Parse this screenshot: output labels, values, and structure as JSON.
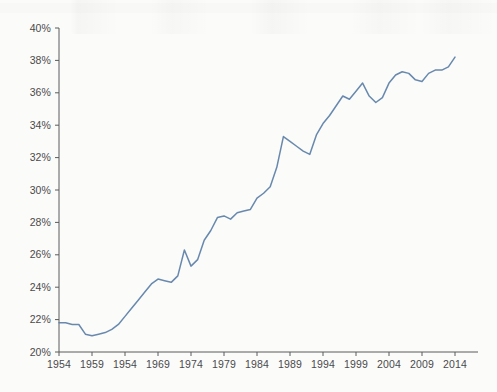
{
  "chart_data": {
    "type": "line",
    "title": "",
    "subtitle": "",
    "xlabel": "",
    "ylabel": "",
    "grid": false,
    "legend": null,
    "legend_position": "none",
    "line_color": "#5b7fa6",
    "axis_color": "#5a5a5a",
    "background_color": "#fbfbfa",
    "xlim": [
      1954,
      2015
    ],
    "ylim": [
      20,
      40
    ],
    "y_tick_labels": [
      "20%",
      "22%",
      "24%",
      "26%",
      "28%",
      "30%",
      "32%",
      "34%",
      "36%",
      "38%",
      "40%"
    ],
    "y_tick_values": [
      20,
      22,
      24,
      26,
      28,
      30,
      32,
      34,
      36,
      38,
      40
    ],
    "x_tick_labels": [
      "1954",
      "1959",
      "1954",
      "1969",
      "1974",
      "1979",
      "1984",
      "1989",
      "1994",
      "1999",
      "2004",
      "2009",
      "2014"
    ],
    "x_tick_values": [
      1954,
      1959,
      1964,
      1969,
      1974,
      1979,
      1984,
      1989,
      1994,
      1999,
      2004,
      2009,
      2014
    ],
    "x": [
      1954,
      1955,
      1956,
      1957,
      1958,
      1959,
      1960,
      1961,
      1962,
      1963,
      1964,
      1965,
      1966,
      1967,
      1968,
      1969,
      1970,
      1971,
      1972,
      1973,
      1974,
      1975,
      1976,
      1977,
      1978,
      1979,
      1980,
      1981,
      1982,
      1983,
      1984,
      1985,
      1986,
      1987,
      1988,
      1989,
      1990,
      1991,
      1992,
      1993,
      1994,
      1995,
      1996,
      1997,
      1998,
      1999,
      2000,
      2001,
      2002,
      2003,
      2004,
      2005,
      2006,
      2007,
      2008,
      2009,
      2010,
      2011,
      2012,
      2013,
      2014
    ],
    "values": [
      21.8,
      21.8,
      21.7,
      21.7,
      21.1,
      21.0,
      21.1,
      21.2,
      21.4,
      21.7,
      22.2,
      22.7,
      23.2,
      23.7,
      24.2,
      24.5,
      24.4,
      24.3,
      24.7,
      26.3,
      25.3,
      25.7,
      26.9,
      27.5,
      28.3,
      28.4,
      28.2,
      28.6,
      28.7,
      28.8,
      29.5,
      29.8,
      30.2,
      31.4,
      33.3,
      33.0,
      32.7,
      32.4,
      32.2,
      33.4,
      34.1,
      34.6,
      35.2,
      35.8,
      35.6,
      36.1,
      36.6,
      35.8,
      35.4,
      35.7,
      36.6,
      37.1,
      37.3,
      37.2,
      36.8,
      36.7,
      37.2,
      37.4,
      37.4,
      37.6,
      38.2
    ],
    "series": [
      {
        "name": "share",
        "color": "#5b7fa6",
        "values": [
          21.8,
          21.8,
          21.7,
          21.7,
          21.1,
          21.0,
          21.1,
          21.2,
          21.4,
          21.7,
          22.2,
          22.7,
          23.2,
          23.7,
          24.2,
          24.5,
          24.4,
          24.3,
          24.7,
          26.3,
          25.3,
          25.7,
          26.9,
          27.5,
          28.3,
          28.4,
          28.2,
          28.6,
          28.7,
          28.8,
          29.5,
          29.8,
          30.2,
          31.4,
          33.3,
          33.0,
          32.7,
          32.4,
          32.2,
          33.4,
          34.1,
          34.6,
          35.2,
          35.8,
          35.6,
          36.1,
          36.6,
          35.8,
          35.4,
          35.7,
          36.6,
          37.1,
          37.3,
          37.2,
          36.8,
          36.7,
          37.2,
          37.4,
          37.4,
          37.6,
          38.2
        ]
      }
    ]
  }
}
